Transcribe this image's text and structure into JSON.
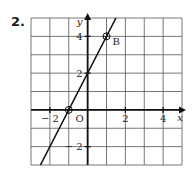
{
  "question": {
    "number": "2."
  },
  "chart_data": {
    "type": "line",
    "title": "",
    "xlabel": "x",
    "ylabel": "y",
    "xlim": [
      -3,
      5
    ],
    "ylim": [
      -3,
      5
    ],
    "grid": true,
    "x_ticks": [
      -2,
      2,
      4
    ],
    "x_tick_labels": [
      "− 2",
      "2",
      "4"
    ],
    "y_ticks": [
      4,
      2,
      -2
    ],
    "y_tick_labels": [
      "4",
      "2",
      "− 2"
    ],
    "origin_label": "O",
    "series": [
      {
        "name": "line",
        "equation": "y = 2x + 2",
        "x": [
          -2.5,
          1.5
        ],
        "y": [
          -3,
          5
        ]
      }
    ],
    "points": [
      {
        "label": "",
        "x": -1,
        "y": 0,
        "marker": "circle"
      },
      {
        "label": "B",
        "x": 1,
        "y": 4,
        "marker": "circle"
      }
    ],
    "colors": {
      "grid": "#333333",
      "axis": "#111111",
      "line": "#111111"
    }
  }
}
